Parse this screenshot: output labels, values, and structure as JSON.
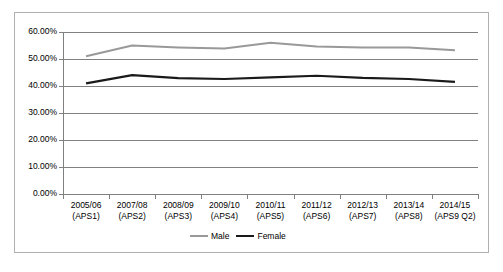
{
  "chart_data": {
    "type": "line",
    "title": "",
    "xlabel": "",
    "ylabel": "",
    "ylim": [
      0,
      60
    ],
    "ytick_step": 10,
    "ytick_format": "percent",
    "grid": true,
    "legend_position": "bottom",
    "categories": [
      "2005/06 (APS1)",
      "2007/08 (APS2)",
      "2008/09 (APS3)",
      "2009/10 (APS4)",
      "2010/11 (APS5)",
      "2011/12 (APS6)",
      "2012/13 (APS7)",
      "2013/14 (APS8)",
      "2014/15 (APS9 Q2)"
    ],
    "category_lines": [
      {
        "year": "2005/06",
        "aps": "(APS1)"
      },
      {
        "year": "2007/08",
        "aps": "(APS2)"
      },
      {
        "year": "2008/09",
        "aps": "(APS3)"
      },
      {
        "year": "2009/10",
        "aps": "(APS4)"
      },
      {
        "year": "2010/11",
        "aps": "(APS5)"
      },
      {
        "year": "2011/12",
        "aps": "(APS6)"
      },
      {
        "year": "2012/13",
        "aps": "(APS7)"
      },
      {
        "year": "2013/14",
        "aps": "(APS8)"
      },
      {
        "year": "2014/15",
        "aps": "(APS9 Q2)"
      }
    ],
    "ytick_labels": [
      "60.00%",
      "50.00%",
      "40.00%",
      "30.00%",
      "20.00%",
      "10.00%",
      "0.00%"
    ],
    "ytick_values": [
      60,
      50,
      40,
      30,
      20,
      10,
      0
    ],
    "series": [
      {
        "name": "Male",
        "color": "#999999",
        "values": [
          51.0,
          55.0,
          54.3,
          53.9,
          56.0,
          54.6,
          54.3,
          54.3,
          53.2
        ]
      },
      {
        "name": "Female",
        "color": "#1a1a1a",
        "values": [
          41.0,
          44.0,
          42.9,
          42.6,
          43.2,
          43.8,
          43.0,
          42.6,
          41.5
        ]
      }
    ]
  },
  "legend": {
    "entries": [
      {
        "label": "Male",
        "color": "#999999"
      },
      {
        "label": "Female",
        "color": "#1a1a1a"
      }
    ]
  }
}
